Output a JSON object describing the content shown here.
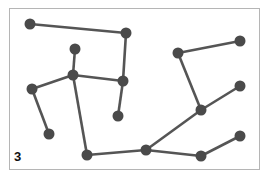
{
  "panel": {
    "label": "3",
    "edge_color": "#555555",
    "node_color": "#4a4a4a",
    "frame_color": "#b5b5b5"
  },
  "graph": {
    "nodes": [
      {
        "id": "A",
        "x": 30,
        "y": 24
      },
      {
        "id": "B",
        "x": 126,
        "y": 33
      },
      {
        "id": "C",
        "x": 75,
        "y": 49
      },
      {
        "id": "D",
        "x": 73,
        "y": 75
      },
      {
        "id": "E",
        "x": 123,
        "y": 81
      },
      {
        "id": "F",
        "x": 118,
        "y": 116
      },
      {
        "id": "G",
        "x": 32,
        "y": 89
      },
      {
        "id": "H",
        "x": 49,
        "y": 134
      },
      {
        "id": "I",
        "x": 87,
        "y": 155
      },
      {
        "id": "J",
        "x": 146,
        "y": 150
      },
      {
        "id": "K",
        "x": 201,
        "y": 156
      },
      {
        "id": "L",
        "x": 240,
        "y": 136
      },
      {
        "id": "M",
        "x": 178,
        "y": 53
      },
      {
        "id": "N",
        "x": 240,
        "y": 41
      },
      {
        "id": "O",
        "x": 201,
        "y": 110
      },
      {
        "id": "P",
        "x": 240,
        "y": 86
      }
    ],
    "edges": [
      [
        "A",
        "B"
      ],
      [
        "B",
        "E"
      ],
      [
        "C",
        "D"
      ],
      [
        "D",
        "E"
      ],
      [
        "D",
        "G"
      ],
      [
        "G",
        "H"
      ],
      [
        "D",
        "I"
      ],
      [
        "E",
        "F"
      ],
      [
        "I",
        "J"
      ],
      [
        "J",
        "O"
      ],
      [
        "O",
        "P"
      ],
      [
        "O",
        "M"
      ],
      [
        "M",
        "N"
      ],
      [
        "J",
        "K"
      ],
      [
        "K",
        "L"
      ]
    ]
  }
}
